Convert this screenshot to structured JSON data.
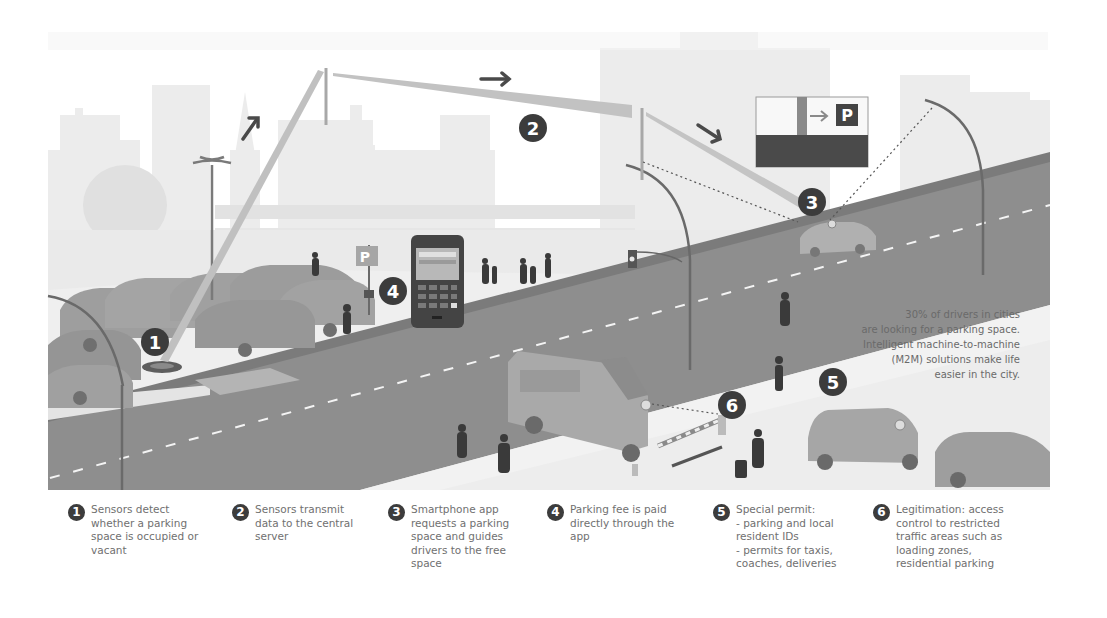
{
  "scene": {
    "badges": [
      "1",
      "2",
      "3",
      "4",
      "5",
      "6"
    ],
    "parking_sign_letter": "P",
    "guide_sign_letter": "P",
    "colors": {
      "sky": "#ffffff",
      "buildings": "#ebebeb",
      "buildings_far": "#f1f1f1",
      "ground": "#e9e9e9",
      "road": "#8e8e8e",
      "road_dark": "#7a7a7a",
      "sidewalk": "#f3f3f3",
      "car": "#a8a8a8",
      "car_dark": "#8a8a8a",
      "badge": "#3c3c3c",
      "signal_beam": "#bcbcbc",
      "arrow": "#4a4a4a",
      "person": "#3a3a3a"
    }
  },
  "stat": {
    "text": "30% of drivers in cities\nare looking for a parking space.\nIntelligent machine-to-machine\n(M2M) solutions make life\neasier in the city."
  },
  "legend": {
    "items": [
      {
        "num": "1",
        "text": "Sensors detect\nwhether a parking\nspace is occupied or\nvacant"
      },
      {
        "num": "2",
        "text": "Sensors transmit\ndata to the central\nserver"
      },
      {
        "num": "3",
        "text": "Smartphone app\nrequests a parking\nspace and guides\ndrivers to the free\nspace"
      },
      {
        "num": "4",
        "text": "Parking fee is paid\ndirectly through the\napp"
      },
      {
        "num": "5",
        "text": "Special permit:\n- parking and local\nresident IDs\n- permits for taxis,\ncoaches, deliveries"
      },
      {
        "num": "6",
        "text": "Legitimation: access\ncontrol to restricted\ntraffic areas such as\nloading zones,\nresidential parking"
      }
    ]
  }
}
